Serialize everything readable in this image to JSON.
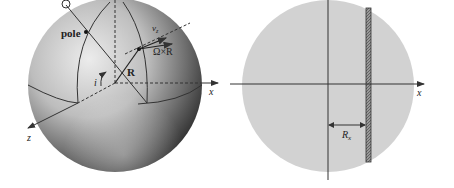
{
  "left_diagram": {
    "labels": {
      "pole": "pole",
      "R": "R",
      "omega_cross_R": "Ω×R",
      "v_z": "v",
      "v_z_sub": "z",
      "inclination": "i",
      "x_axis": "x",
      "z_axis": "z"
    }
  },
  "right_diagram": {
    "labels": {
      "x_axis": "x",
      "R_x": "R",
      "R_x_sub": "x"
    }
  },
  "colors": {
    "disk_fill": "#d2d2d2",
    "line": "#333333",
    "sphere_light": "#e6e6e6",
    "sphere_dark": "#2a2a2a"
  }
}
